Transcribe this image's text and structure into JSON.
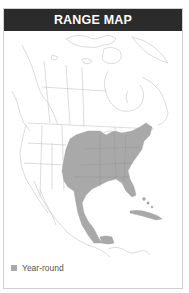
{
  "header": {
    "title": "RANGE MAP"
  },
  "legend": {
    "items": [
      {
        "label": "Year-round",
        "color": "#aaaaaa"
      }
    ]
  },
  "colors": {
    "header_bg": "#2b2b2b",
    "range_fill": "#a9a9a9",
    "land_outline": "#c8c8c8",
    "border": "#cfcfcf"
  }
}
